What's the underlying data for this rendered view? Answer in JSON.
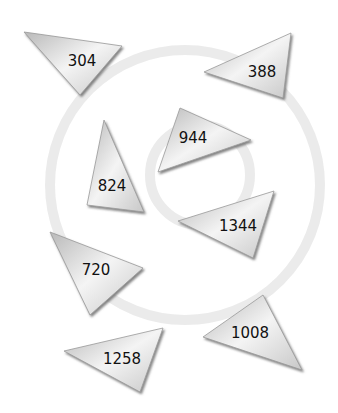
{
  "puzzle": {
    "watermark": "gechallengechallengechallenge",
    "triangles": [
      {
        "label": "304",
        "points": "24,32 122,46 80,95",
        "cx": 82,
        "cy": 61
      },
      {
        "label": "388",
        "points": "204,72 291,33 283,98",
        "cx": 262,
        "cy": 72
      },
      {
        "label": "944",
        "points": "180,108 251,140 158,172",
        "cx": 193,
        "cy": 138
      },
      {
        "label": "824",
        "points": "104,120 144,212 87,205",
        "cx": 112,
        "cy": 186
      },
      {
        "label": "1344",
        "points": "178,221 274,191 253,258",
        "cx": 238,
        "cy": 226
      },
      {
        "label": "720",
        "points": "50,232 143,268 90,315",
        "cx": 96,
        "cy": 270
      },
      {
        "label": "1258",
        "points": "64,351 163,328 140,392",
        "cx": 122,
        "cy": 359
      },
      {
        "label": "1008",
        "points": "203,337 263,295 302,370",
        "cx": 250,
        "cy": 333
      }
    ]
  }
}
